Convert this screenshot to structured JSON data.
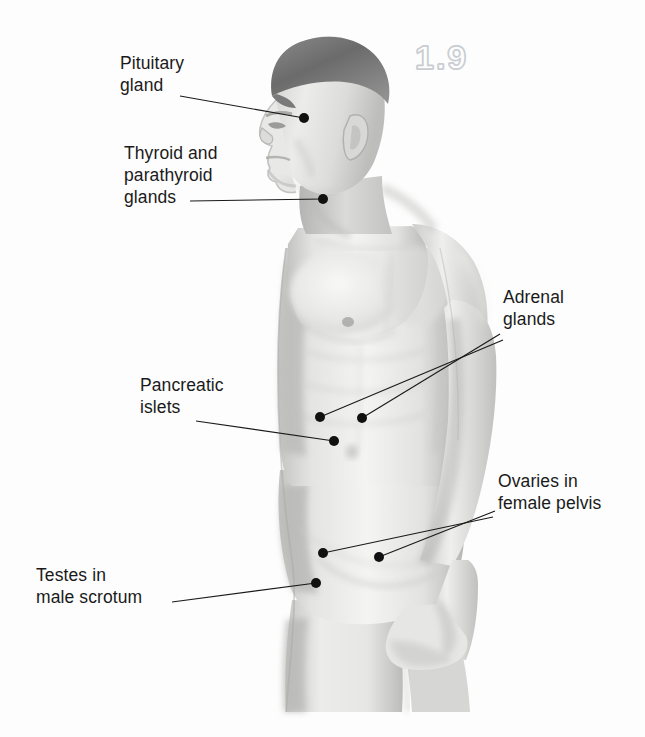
{
  "figure": {
    "number": "1.9",
    "background_color": "#fdfdfd",
    "ink_color": "#1a1a1a",
    "figure_number_outline_color": "#c9cdd2"
  },
  "callouts": [
    {
      "id": "pituitary",
      "label": "Pituitary\ngland",
      "text_x": 120,
      "text_y": 52,
      "leader": [
        [
          180,
          96
        ],
        [
          304,
          118
        ]
      ],
      "dot": [
        304,
        118
      ]
    },
    {
      "id": "thyroid-parathyroid",
      "label": "Thyroid and\nparathyroid\nglands",
      "text_x": 124,
      "text_y": 142,
      "leader": [
        [
          190,
          201
        ],
        [
          323,
          199
        ]
      ],
      "dot": [
        323,
        199
      ]
    },
    {
      "id": "adrenal",
      "label": "Adrenal\nglands",
      "text_x": 503,
      "text_y": 286,
      "leader": [
        [
          500,
          334
        ],
        [
          362,
          418
        ]
      ],
      "leader2": [
        [
          503,
          340
        ],
        [
          320,
          417
        ]
      ],
      "dot": [
        362,
        418
      ],
      "dot2": [
        320,
        417
      ]
    },
    {
      "id": "pancreatic-islets",
      "label": "Pancreatic\nislets",
      "text_x": 140,
      "text_y": 374,
      "leader": [
        [
          196,
          421
        ],
        [
          334,
          441
        ]
      ],
      "dot": [
        334,
        441
      ]
    },
    {
      "id": "ovaries",
      "label": "Ovaries in\nfemale pelvis",
      "text_x": 498,
      "text_y": 470,
      "leader": [
        [
          495,
          511
        ],
        [
          379,
          557
        ]
      ],
      "leader2": [
        [
          493,
          517
        ],
        [
          323,
          553
        ]
      ],
      "dot": [
        379,
        557
      ],
      "dot2": [
        323,
        553
      ]
    },
    {
      "id": "testes",
      "label": "Testes in\nmale scrotum",
      "text_x": 36,
      "text_y": 564,
      "leader": [
        [
          172,
          602
        ],
        [
          316,
          583
        ]
      ],
      "dot": [
        316,
        583
      ]
    }
  ],
  "illustration": {
    "description": "grayscale-airbrush-male-figure-three-quarter-profile",
    "skin_light": "#f2f2f0",
    "skin_mid": "#dcdcda",
    "skin_shadow": "#b9b9b7",
    "hair_dark": "#6e6e6e",
    "hair_mid": "#8f8f8f"
  }
}
